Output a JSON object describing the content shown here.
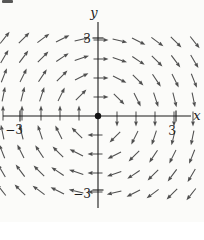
{
  "figure": {
    "background": "#fbfbf9",
    "artifact": {
      "note": "small dark scan mark in top-left corner",
      "color": "#3a3a3a"
    }
  },
  "chart_data": {
    "type": "vector_field",
    "title": "",
    "xlabel": "x",
    "ylabel": "y",
    "x_ticks": [
      -3,
      3
    ],
    "y_ticks": [
      3,
      -3
    ],
    "x_tick_labels": [
      "−3",
      "3"
    ],
    "y_tick_labels": [
      "3",
      "−3"
    ],
    "xlim": [
      -3.65,
      4.08
    ],
    "ylim": [
      -4.08,
      3.62
    ],
    "field_formula": "(dx, dy) = (y, -x)",
    "rotation": "clockwise",
    "grid_on": false,
    "origin_dot": {
      "show": true,
      "radius_px": 3.2,
      "color": "#141414"
    },
    "axis_color": "#1a1a1a",
    "arrow": {
      "color": "#4f4f4f",
      "length_px": 15,
      "back_fraction": 0.3,
      "head_length_px": 5,
      "head_half_width_px": 1.9,
      "shaft_width_px": 1.05
    },
    "sample_grid": {
      "spacing_px": 19,
      "cols_from": -5,
      "cols_to": 5,
      "rows_from": -4,
      "rows_to": 4,
      "skip_origin": true
    },
    "layout_px": {
      "width": 204,
      "height": 222,
      "origin_x": 98,
      "origin_y": 116,
      "unit": 26,
      "x_axis_start": 3,
      "x_axis_end": 191,
      "y_axis_start": 22,
      "y_axis_end": 208,
      "tick_half_len": 5.5
    }
  }
}
